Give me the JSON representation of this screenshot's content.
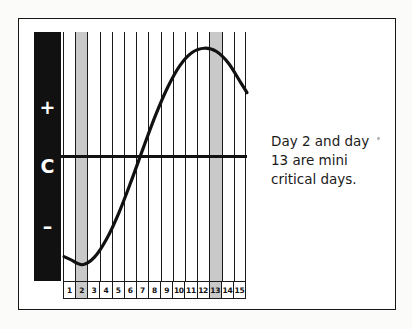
{
  "figure": {
    "name": "biorhythm-cycle-chart",
    "legend": {
      "above_label": "+",
      "center_label": "C",
      "below_label": "–"
    },
    "caption_lines": [
      "Day 2 and day",
      "13 are mini",
      "critical days."
    ],
    "caption_text": "Day 2 and day 13 are mini critical days.",
    "colors": {
      "ink": "#111111",
      "shaded_column": "#c9c9c9",
      "paper": "#ffffff",
      "page_background": "#fbfbfa"
    }
  },
  "chart_data": {
    "type": "line",
    "title": "",
    "xlabel": "",
    "ylabel": "",
    "grid": true,
    "legend_position": "none",
    "x": [
      1,
      2,
      3,
      4,
      5,
      6,
      7,
      8,
      9,
      10,
      11,
      12,
      13,
      14,
      15
    ],
    "categories": [
      "1",
      "2",
      "3",
      "4",
      "5",
      "6",
      "7",
      "8",
      "9",
      "10",
      "11",
      "12",
      "13",
      "14",
      "15"
    ],
    "series": [
      {
        "name": "cycle",
        "values": [
          -0.95,
          -1.0,
          -0.93,
          -0.76,
          -0.52,
          -0.23,
          0.08,
          0.38,
          0.64,
          0.84,
          0.96,
          1.0,
          0.97,
          0.86,
          0.68
        ]
      }
    ],
    "ylim": [
      -1.15,
      1.15
    ],
    "baseline_value": 0,
    "baseline_label": "C",
    "above_baseline_label": "+",
    "below_baseline_label": "–",
    "highlighted_days": [
      2,
      13
    ],
    "highlight_meaning": "mini critical days",
    "annotations": [
      "Day 2 and day 13 are mini critical days."
    ]
  }
}
